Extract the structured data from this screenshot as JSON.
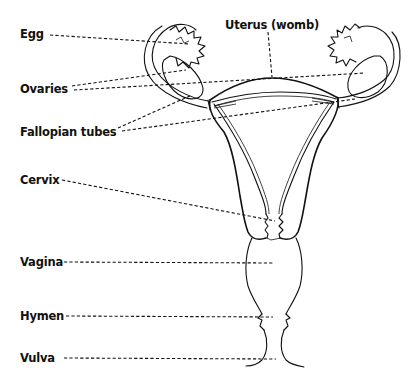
{
  "diagram": {
    "type": "anatomical-labelled-illustration",
    "line_color": "#111111",
    "background": "#ffffff",
    "labels": [
      {
        "id": "egg",
        "text": "Egg"
      },
      {
        "id": "uterus",
        "text": "Uterus (womb)"
      },
      {
        "id": "ovaries",
        "text": "Ovaries"
      },
      {
        "id": "fallopian-tubes",
        "text": "Fallopian tubes"
      },
      {
        "id": "cervix",
        "text": "Cervix"
      },
      {
        "id": "vagina",
        "text": "Vagina"
      },
      {
        "id": "hymen",
        "text": "Hymen"
      },
      {
        "id": "vulva",
        "text": "Vulva"
      }
    ]
  }
}
